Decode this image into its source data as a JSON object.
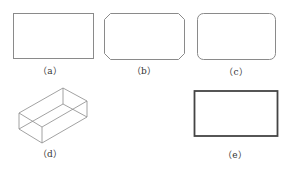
{
  "figure": {
    "colors": {
      "stroke": "#8a8a8a",
      "stroke_dark": "#444444",
      "label": "#333333"
    },
    "panels": [
      {
        "id": "a",
        "label": "（a）",
        "shape": "rectangle"
      },
      {
        "id": "b",
        "label": "（b）",
        "shape": "chamfered-rectangle"
      },
      {
        "id": "c",
        "label": "（c）",
        "shape": "rounded-rectangle"
      },
      {
        "id": "d",
        "label": "（d）",
        "shape": "wireframe-box"
      },
      {
        "id": "e",
        "label": "（e）",
        "shape": "thick-rectangle"
      }
    ]
  }
}
